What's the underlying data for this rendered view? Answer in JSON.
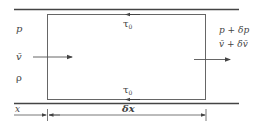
{
  "diagram": {
    "type": "control-volume-pipe-flow",
    "colors": {
      "line": "#555555",
      "wall": "#444444",
      "text": "#444444"
    },
    "inlet": {
      "pressure": "p",
      "velocity": "v̄",
      "density": "ρ"
    },
    "outlet": {
      "pressure": "p + δp",
      "velocity": "v̄ + δv̄"
    },
    "shear": {
      "top": {
        "symbol": "τ",
        "subscript": "0"
      },
      "bottom": {
        "symbol": "τ",
        "subscript": "0"
      }
    },
    "dimensions": {
      "position": "x",
      "length": "δx"
    }
  }
}
